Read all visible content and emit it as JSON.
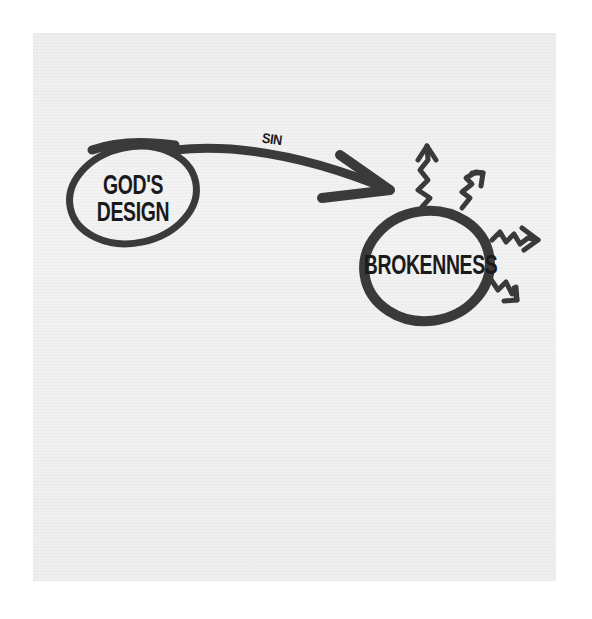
{
  "diagram": {
    "nodes": [
      {
        "id": "gods-design",
        "label": "GOD'S\nDESIGN",
        "line1": "GOD'S",
        "line2": "DESIGN"
      },
      {
        "id": "brokenness",
        "label": "BROKENNESS"
      }
    ],
    "edges": [
      {
        "from": "gods-design",
        "to": "brokenness",
        "label": "SIN"
      }
    ],
    "decorations": {
      "squiggly_arrows_from_brokenness": 4
    },
    "colors": {
      "ink": "#3a3a3a",
      "text": "#1a1a1a",
      "paper": "#f0f0f0",
      "background": "#ffffff"
    }
  }
}
